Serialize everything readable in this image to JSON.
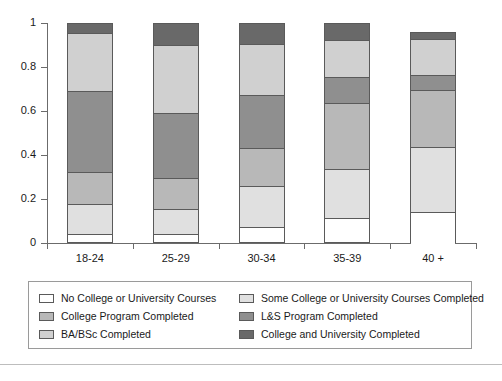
{
  "chart_data": {
    "type": "bar",
    "barmode": "stacked",
    "title": "",
    "xlabel": "",
    "ylabel": "",
    "categories": [
      "18-24",
      "25-29",
      "30-34",
      "35-39",
      "40 +"
    ],
    "ylim": [
      0,
      1
    ],
    "ytick_labels": [
      "0",
      "0.2",
      "0.4",
      "0.6",
      "0.8",
      "1"
    ],
    "ytick_values": [
      0,
      0.2,
      0.4,
      0.6,
      0.8,
      1
    ],
    "grid": false,
    "legend_position": "bottom",
    "series": [
      {
        "name": "No College or University Courses",
        "color": "#ffffff",
        "values": [
          0.03,
          0.03,
          0.065,
          0.105,
          0.175
        ]
      },
      {
        "name": "Some College or University Courses Completed",
        "color": "#e0e0e0",
        "values": [
          0.14,
          0.115,
          0.185,
          0.225,
          0.295
        ]
      },
      {
        "name": "College Program Completed",
        "color": "#b8b8b8",
        "values": [
          0.145,
          0.145,
          0.175,
          0.305,
          0.265
        ]
      },
      {
        "name": "L&S Program Completed",
        "color": "#8f8f8f",
        "values": [
          0.375,
          0.295,
          0.245,
          0.115,
          0.065
        ]
      },
      {
        "name": "BA/BSc Completed",
        "color": "#d0d0d0",
        "values": [
          0.265,
          0.315,
          0.235,
          0.17,
          0.165
        ]
      },
      {
        "name": "College and University Completed",
        "color": "#696969",
        "values": [
          0.045,
          0.1,
          0.095,
          0.08,
          0.035
        ]
      }
    ],
    "totals": [
      1.0,
      1.0,
      1.0,
      1.0,
      0.96
    ]
  },
  "axis": {
    "y_labels": [
      "1",
      "0.8",
      "0.6",
      "0.4",
      "0.2",
      "0"
    ]
  },
  "legend": {
    "items": [
      {
        "label": "No College or University Courses",
        "color": "#ffffff"
      },
      {
        "label": "Some College or University Courses Completed",
        "color": "#e0e0e0"
      },
      {
        "label": "College Program Completed",
        "color": "#b8b8b8"
      },
      {
        "label": "L&S Program Completed",
        "color": "#8f8f8f"
      },
      {
        "label": "BA/BSc Completed",
        "color": "#d0d0d0"
      },
      {
        "label": "College and University Completed",
        "color": "#696969"
      }
    ]
  }
}
